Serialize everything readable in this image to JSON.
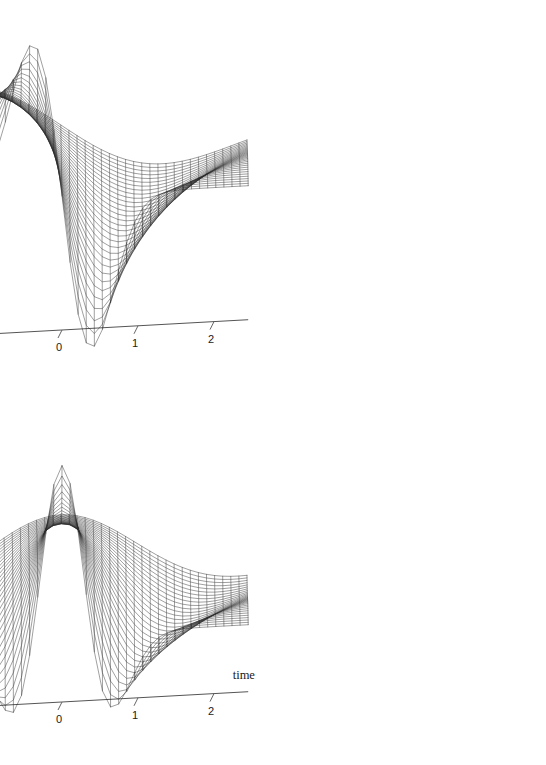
{
  "figure": {
    "background_color": "#ffffff",
    "line_color": "#2b2b2b",
    "axis_color": "#555555",
    "panel_count": 2
  },
  "chart_data": [
    {
      "type": "line",
      "render": "surface-mesh-3d",
      "panel": "top",
      "title": "",
      "subtitle": "",
      "xlabel": "",
      "ylabel": "",
      "zlabel": "",
      "wavelet": "first-derivative-of-gaussian",
      "formula": "z = -t * exp(-(t^2 + r^2/s^2)) scaled, odd in time",
      "x": {
        "name": "time",
        "ticks": [
          -2,
          -1,
          0,
          1,
          2
        ],
        "tick_labels": [
          "-2",
          "-1",
          "0",
          "1",
          "2"
        ],
        "range": [
          -2.6,
          2.6
        ]
      },
      "y": {
        "name": "radius",
        "ticks": [
          0,
          2
        ],
        "tick_labels": [
          "0",
          "2"
        ],
        "range": [
          -0.3,
          2.6
        ]
      },
      "z": {
        "name": "",
        "ticks": [
          -0.2,
          -0.15,
          -0.1,
          -0.05,
          0,
          0.05,
          0.1,
          0.15,
          0.2
        ],
        "tick_labels": [
          "-0.2",
          "-0.15",
          "-0.1",
          "-0.05",
          "0",
          "0.05",
          "0.1",
          "0.15",
          "0.2"
        ],
        "range": [
          -0.2,
          0.2
        ]
      },
      "peak_value": 0.115,
      "trough_value": -0.2,
      "grid": false,
      "legend": "none",
      "mesh_divisions_x": 46,
      "mesh_divisions_y": 30
    },
    {
      "type": "line",
      "render": "surface-mesh-3d",
      "panel": "bottom",
      "title": "",
      "subtitle": "",
      "xlabel": "time",
      "ylabel": "radius",
      "zlabel": "",
      "wavelet": "mexican-hat-ricker",
      "formula": "z = (1 - 2t^2) * exp(-(t^2 + r^2/s^2)) scaled, even in time",
      "x": {
        "name": "time",
        "ticks": [
          -2,
          -1,
          0,
          1,
          2
        ],
        "tick_labels": [
          "-2",
          "-1",
          "0",
          "1",
          "2"
        ],
        "range": [
          -2.6,
          2.6
        ]
      },
      "y": {
        "name": "radius",
        "ticks": [
          0,
          2
        ],
        "tick_labels": [
          "0",
          "2"
        ],
        "range": [
          -0.3,
          2.6
        ]
      },
      "z": {
        "name": "",
        "ticks": [
          -0.1,
          0,
          0.1,
          0.2,
          0.3
        ],
        "tick_labels": [
          "-0.1",
          "0",
          "0.1",
          "0.2",
          "0.3"
        ],
        "range": [
          -0.1,
          0.3
        ]
      },
      "peak_value": 0.3,
      "trough_value": -0.1,
      "grid": false,
      "legend": "none",
      "mesh_divisions_x": 46,
      "mesh_divisions_y": 30
    }
  ],
  "labels": {
    "time": "time",
    "radius": "radius"
  }
}
